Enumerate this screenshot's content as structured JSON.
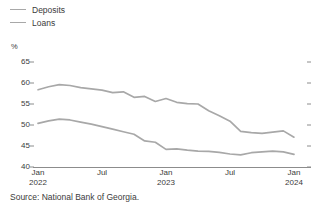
{
  "chart_data": {
    "type": "line",
    "title": "",
    "subtitle": "",
    "unit_label": "%",
    "xlabel": "",
    "ylabel": "",
    "ylim": [
      40,
      65
    ],
    "yticks": [
      40,
      45,
      50,
      55,
      60,
      65
    ],
    "ytick_labels": [
      "40",
      "45",
      "50",
      "55",
      "60",
      "65"
    ],
    "grid": false,
    "legend_position": "top-left",
    "x_tick_labels": [
      {
        "month": "Jan",
        "year": "2022"
      },
      {
        "month": "Jul",
        "year": ""
      },
      {
        "month": "Jan",
        "year": "2023"
      },
      {
        "month": "Jul",
        "year": ""
      },
      {
        "month": "Jan",
        "year": "2024"
      }
    ],
    "x": [
      "2022-01",
      "2022-02",
      "2022-03",
      "2022-04",
      "2022-05",
      "2022-06",
      "2022-07",
      "2022-08",
      "2022-09",
      "2022-10",
      "2022-11",
      "2022-12",
      "2023-01",
      "2023-02",
      "2023-03",
      "2023-04",
      "2023-05",
      "2023-06",
      "2023-07",
      "2023-08",
      "2023-09",
      "2023-10",
      "2023-11",
      "2023-12",
      "2024-01"
    ],
    "xlim": [
      "2022-01",
      "2024-01"
    ],
    "series": [
      {
        "name": "Deposits",
        "color": "#a8a8a8",
        "values": [
          58.4,
          59.1,
          59.6,
          59.4,
          58.9,
          58.6,
          58.3,
          57.7,
          57.9,
          56.6,
          56.8,
          55.6,
          56.3,
          55.4,
          55.1,
          55.0,
          53.4,
          52.2,
          50.9,
          48.5,
          48.2,
          48.0,
          48.3,
          48.6,
          47.1
        ]
      },
      {
        "name": "Loans",
        "color": "#a8a8a8",
        "values": [
          50.4,
          51.0,
          51.4,
          51.2,
          50.7,
          50.2,
          49.6,
          49.0,
          48.4,
          47.8,
          46.2,
          45.9,
          44.2,
          44.3,
          44.0,
          43.8,
          43.7,
          43.5,
          43.1,
          42.9,
          43.4,
          43.6,
          43.8,
          43.6,
          43.0
        ]
      }
    ]
  },
  "legend": {
    "items": [
      {
        "label": "Deposits"
      },
      {
        "label": "Loans"
      }
    ]
  },
  "footer": {
    "source": "Source: National Bank of Georgia."
  }
}
